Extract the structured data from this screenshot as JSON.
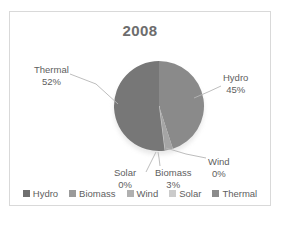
{
  "chart_data": {
    "type": "pie",
    "title": "2008",
    "categories": [
      "Hydro",
      "Biomass",
      "Wind",
      "Solar",
      "Thermal"
    ],
    "values": [
      45,
      3,
      0,
      0,
      52
    ],
    "value_suffix": "%",
    "legend_position": "bottom",
    "grid": false,
    "slices": [
      {
        "name": "Hydro",
        "value": 45,
        "value_text": "45%",
        "color": "#8a8a8a"
      },
      {
        "name": "Biomass",
        "value": 3,
        "value_text": "3%",
        "color": "#a5a5a5"
      },
      {
        "name": "Wind",
        "value": 0,
        "value_text": "0%",
        "color": "#b8b8b8"
      },
      {
        "name": "Solar",
        "value": 0,
        "value_text": "0%",
        "color": "#cfcfcf"
      },
      {
        "name": "Thermal",
        "value": 52,
        "value_text": "52%",
        "color": "#777777"
      }
    ]
  },
  "title": "2008",
  "callouts": {
    "thermal": {
      "name": "Thermal",
      "value": "52%"
    },
    "hydro": {
      "name": "Hydro",
      "value": "45%"
    },
    "solar": {
      "name": "Solar",
      "value": "0%"
    },
    "biomass": {
      "name": "Biomass",
      "value": "3%"
    },
    "wind": {
      "name": "Wind",
      "value": "0%"
    }
  },
  "legend": {
    "items": [
      {
        "label": "Hydro",
        "swatch_icon": "legend-swatch-icon",
        "color": "#6f6f6f"
      },
      {
        "label": "Biomass",
        "swatch_icon": "legend-swatch-icon",
        "color": "#9a9a9a"
      },
      {
        "label": "Wind",
        "swatch_icon": "legend-swatch-icon",
        "color": "#b0b0b0"
      },
      {
        "label": "Solar",
        "swatch_icon": "legend-swatch-icon",
        "color": "#cbcbcb"
      },
      {
        "label": "Thermal",
        "swatch_icon": "legend-swatch-icon",
        "color": "#8b8b8b"
      }
    ]
  },
  "caption": ""
}
